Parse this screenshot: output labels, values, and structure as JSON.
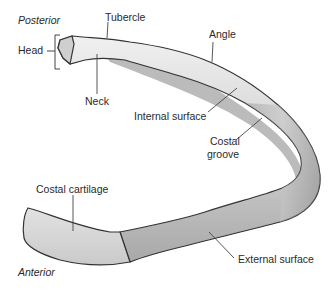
{
  "figure": {
    "orientation": {
      "posterior": "Posterior",
      "anterior": "Anterior"
    },
    "labels": {
      "head": "Head",
      "tubercle": "Tubercle",
      "neck": "Neck",
      "angle": "Angle",
      "internal_surface": "Internal surface",
      "costal_groove_line1": "Costal",
      "costal_groove_line2": "groove",
      "costal_cartilage": "Costal cartilage",
      "external_surface": "External surface"
    },
    "colors": {
      "bone_light": "#e6e6e6",
      "bone_mid": "#c8c8c8",
      "bone_dark": "#8a8a8a",
      "outline": "#333333",
      "cartilage": "#dcdcdc",
      "leader": "#444444",
      "text": "#2a2a2a"
    }
  }
}
